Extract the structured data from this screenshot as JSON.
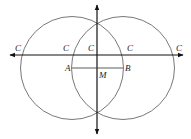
{
  "diagram": {
    "type": "geometric-construction",
    "colors": {
      "stroke": "#555555",
      "axis": "#111111",
      "label": "#222222",
      "background": "#ffffff"
    },
    "circles": [
      {
        "name": "left-circle",
        "center": "A",
        "cx": 72,
        "cy": 68,
        "r": 51.5
      },
      {
        "name": "right-circle",
        "center": "B",
        "cx": 123,
        "cy": 68,
        "r": 51.5
      }
    ],
    "axes": {
      "horizontal": {
        "y": 55,
        "x1": 10,
        "x2": 183,
        "arrows": "both"
      },
      "vertical": {
        "x": 97,
        "y1": 5,
        "y2": 134,
        "arrows": "both"
      }
    },
    "segment": {
      "from": "A",
      "to": "B",
      "y": 68,
      "x1": 72,
      "x2": 123
    },
    "labels": {
      "c1": "C",
      "c2": "C",
      "c3": "C",
      "c4": "C",
      "c5": "C",
      "a": "A",
      "b": "B",
      "m": "M"
    }
  }
}
